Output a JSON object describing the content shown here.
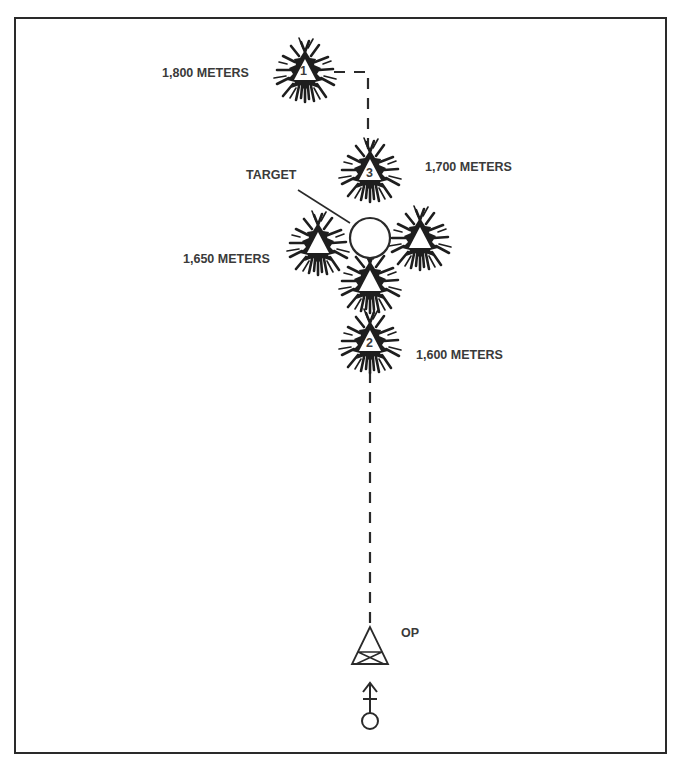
{
  "diagram": {
    "type": "adjustment-of-fire-bracketing",
    "bursts": [
      {
        "id": "burst-1",
        "number": "1",
        "range_label": "1,800 METERS",
        "cx": 305,
        "cy": 72
      },
      {
        "id": "burst-3",
        "number": "3",
        "range_label": "1,700 METERS",
        "cx": 370,
        "cy": 175
      },
      {
        "id": "burst-2",
        "number": "2",
        "range_label": "1,600 METERS",
        "cx": 370,
        "cy": 345
      },
      {
        "id": "burst-fx-left",
        "number": "",
        "range_label": "1,650 METERS",
        "cx": 318,
        "cy": 245
      },
      {
        "id": "burst-fx-right",
        "number": "",
        "range_label": "",
        "cx": 420,
        "cy": 240
      },
      {
        "id": "burst-fx-bottom",
        "number": "",
        "range_label": "",
        "cx": 370,
        "cy": 283
      }
    ],
    "target": {
      "label": "TARGET",
      "cx": 370,
      "cy": 238,
      "r": 20
    },
    "observer": {
      "label": "OP"
    },
    "labels": {
      "r1800": "1,800 METERS",
      "r1700": "1,700 METERS",
      "r1650": "1,650 METERS",
      "r1600": "1,600 METERS",
      "target": "TARGET",
      "op": "OP",
      "n1": "1",
      "n2": "2",
      "n3": "3"
    },
    "colors": {
      "ink": "#2a2a2a",
      "text": "#3a3a3a",
      "background": "#ffffff"
    }
  }
}
